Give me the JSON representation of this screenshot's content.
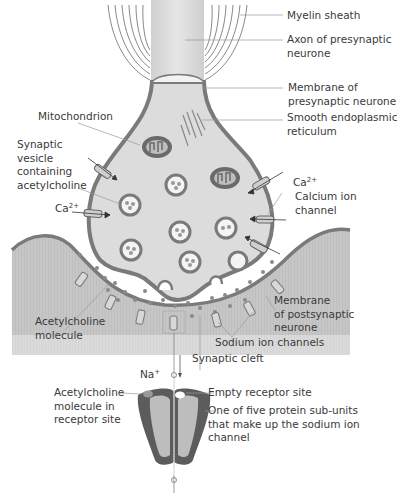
{
  "diagram": {
    "colors": {
      "membrane": "#7a7a7a",
      "cytoplasm": "#dedede",
      "postsynaptic": "#c4c4c4",
      "organelle_dark": "#6a6a6a",
      "text": "#3a3a3a",
      "leader": "#999999"
    },
    "labels": {
      "myelin_sheath": "Myelin sheath",
      "axon_line1": "Axon of presynaptic",
      "axon_line2": "neurone",
      "pre_membrane_line1": "Membrane of",
      "pre_membrane_line2": "presynaptic neurone",
      "ser_line1": "Smooth endoplasmic",
      "ser_line2": "reticulum",
      "mitochondrion": "Mitochondrion",
      "vesicle_line1": "Synaptic",
      "vesicle_line2": "vesicle",
      "vesicle_line3": "containing",
      "vesicle_line4": "acetylcholine",
      "ca_left": "Ca",
      "ca_left_sup": "2+",
      "ca_right": "Ca",
      "ca_right_sup": "2+",
      "ca_channel_line1": "Calcium ion",
      "ca_channel_line2": "channel",
      "ach_molecule_line1": "Acetylcholine",
      "ach_molecule_line2": "molecule",
      "post_membrane_line1": "Membrane",
      "post_membrane_line2": "of postsynaptic",
      "post_membrane_line3": "neurone",
      "sodium_channels": "Sodium ion channels",
      "synaptic_cleft": "Synaptic cleft",
      "na": "Na",
      "na_sup": "+",
      "ach_in_site_line1": "Acetylcholine",
      "ach_in_site_line2": "molecule in",
      "ach_in_site_line3": "receptor site",
      "empty_site": "Empty receptor site",
      "subunit_line1": "One of five protein sub-units",
      "subunit_line2": "that make up the sodium ion",
      "subunit_line3": "channel"
    }
  }
}
